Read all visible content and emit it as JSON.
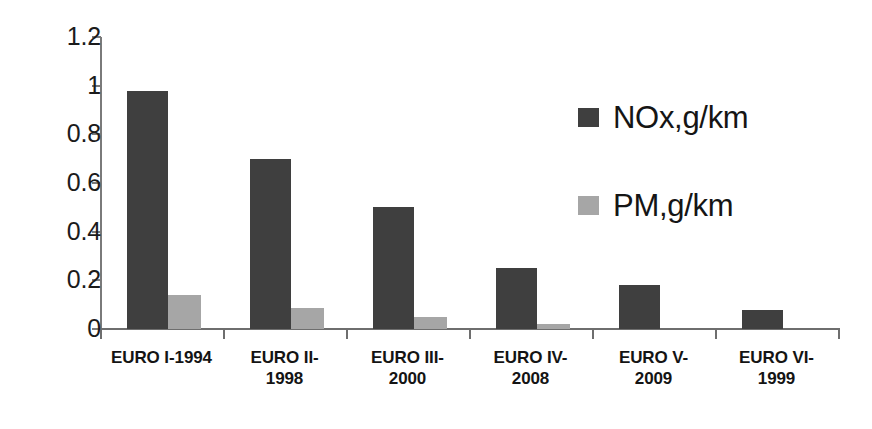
{
  "chart_data": {
    "type": "bar",
    "title": "",
    "xlabel": "",
    "ylabel": "",
    "ylim": [
      0,
      1.2
    ],
    "grid": false,
    "legend_position": "right",
    "categories": [
      "EURO I-1994",
      "EURO II-1998",
      "EURO III-2000",
      "EURO IV-2008",
      "EURO V-2009",
      "EURO VI-1999"
    ],
    "category_lines": [
      [
        "EURO I-1994"
      ],
      [
        "EURO II-",
        "1998"
      ],
      [
        "EURO III-",
        "2000"
      ],
      [
        "EURO IV-",
        "2008"
      ],
      [
        "EURO V-",
        "2009"
      ],
      [
        "EURO VI-",
        "1999"
      ]
    ],
    "series": [
      {
        "name": "NOx,g/km",
        "color": "#3f3f3f",
        "values": [
          0.98,
          0.7,
          0.5,
          0.25,
          0.18,
          0.08
        ]
      },
      {
        "name": "PM,g/km",
        "color": "#a6a6a6",
        "values": [
          0.14,
          0.085,
          0.05,
          0.02,
          0,
          0
        ]
      }
    ],
    "yticks": [
      0,
      0.2,
      0.4,
      0.6,
      0.8,
      1,
      1.2
    ],
    "ytick_labels": [
      "0",
      "0.2",
      "0.4",
      "0.6",
      "0.8",
      "1",
      "1.2"
    ]
  },
  "legend": {
    "items": [
      {
        "label": "NOx,g/km",
        "color": "#3f3f3f"
      },
      {
        "label": "PM,g/km",
        "color": "#a6a6a6"
      }
    ]
  },
  "colors": {
    "background": "#ffffff",
    "axis": "#6e6e6e",
    "nox": "#3f3f3f",
    "pm": "#a6a6a6",
    "text": "#141414"
  }
}
